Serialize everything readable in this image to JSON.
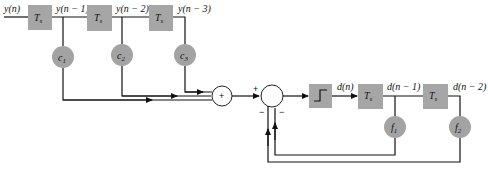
{
  "diagram": {
    "type": "decision feedback equalizer block diagram",
    "input_label": "y(n)",
    "delay_label": "T",
    "delay_subscript": "s",
    "feedforward": {
      "taps": [
        {
          "label": "y(n − 1)",
          "coef_base": "c",
          "coef_sub": "1"
        },
        {
          "label": "y(n − 2)",
          "coef_base": "c",
          "coef_sub": "2"
        },
        {
          "label": "y(n − 3)",
          "coef_base": "c",
          "coef_sub": "3"
        }
      ]
    },
    "summer1_sign": "+",
    "summer2_signs": {
      "plus": "+",
      "minus1": "−",
      "minus2": "−"
    },
    "decision_output_label": "d(n)",
    "feedback": {
      "taps": [
        {
          "label": "d(n − 1)",
          "coef_base": "f",
          "coef_sub": "1"
        },
        {
          "label": "d(n − 2)",
          "coef_base": "f",
          "coef_sub": "2"
        }
      ]
    },
    "colors": {
      "block_fill": "#a6a6a6",
      "line": "#111111",
      "background": "#ffffff"
    }
  }
}
